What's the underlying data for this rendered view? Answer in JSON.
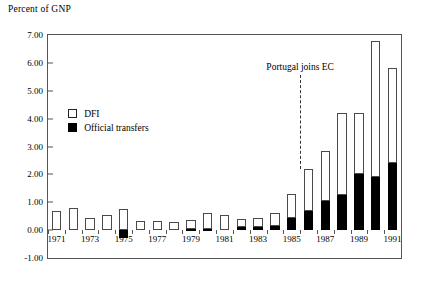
{
  "axis_title": "Percent of GNP",
  "legend": {
    "position": "inside-upper-left",
    "items": [
      {
        "label": "DFI",
        "swatch": "open-square",
        "color": "#ffffff"
      },
      {
        "label": "Official transfers",
        "swatch": "filled-square",
        "color": "#000000"
      }
    ]
  },
  "annotation": {
    "text": "Portugal joins EC",
    "at_x": 1985.5
  },
  "chart_data": {
    "type": "bar",
    "stacked": true,
    "title": "",
    "subtitle": "",
    "xlabel": "",
    "ylabel": "Percent of GNP",
    "ylim": [
      -1.0,
      7.0
    ],
    "yticks": [
      -1.0,
      0.0,
      1.0,
      2.0,
      3.0,
      4.0,
      5.0,
      6.0,
      7.0
    ],
    "ytick_labels": [
      "-1.00",
      "0.00",
      "1.00",
      "2.00",
      "3.00",
      "4.00",
      "5.00",
      "6.00",
      "7.00"
    ],
    "grid": false,
    "legend_position": "upper left inside",
    "categories": [
      1971,
      1972,
      1973,
      1974,
      1975,
      1976,
      1977,
      1978,
      1979,
      1980,
      1981,
      1982,
      1983,
      1984,
      1985,
      1986,
      1987,
      1988,
      1989,
      1990,
      1991
    ],
    "xtick_labels": [
      "1971",
      "1973",
      "1975",
      "1977",
      "1979",
      "1981",
      "1983",
      "1985",
      "1987",
      "1989",
      "1991"
    ],
    "series": [
      {
        "name": "Official transfers",
        "color": "#000000",
        "values": [
          0.0,
          0.0,
          0.0,
          0.0,
          -0.3,
          0.0,
          0.0,
          0.0,
          0.05,
          0.05,
          0.0,
          0.1,
          0.12,
          0.15,
          0.45,
          0.7,
          1.05,
          1.25,
          2.0,
          1.9,
          2.4
        ]
      },
      {
        "name": "DFI",
        "color": "#ffffff",
        "values": [
          0.67,
          0.8,
          0.45,
          0.55,
          0.77,
          0.33,
          0.33,
          0.28,
          0.3,
          0.55,
          0.55,
          0.3,
          0.33,
          0.45,
          0.85,
          1.5,
          1.8,
          2.95,
          2.2,
          4.9,
          3.4
        ]
      }
    ],
    "totals": [
      0.67,
      0.8,
      0.45,
      0.55,
      0.77,
      0.33,
      0.33,
      0.28,
      0.35,
      0.6,
      0.55,
      0.4,
      0.45,
      0.6,
      1.3,
      2.2,
      2.85,
      4.2,
      4.2,
      6.8,
      5.8
    ]
  }
}
